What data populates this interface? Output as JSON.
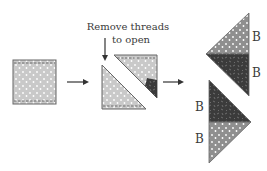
{
  "annotation": {
    "line1": "Remove threads",
    "line2": "to open"
  },
  "labels": {
    "top_upper": "B",
    "top_lower": "B",
    "bottom_upper": "B",
    "bottom_lower": "B"
  },
  "colors": {
    "light_fabric": "#c9c9c9",
    "medium_fabric": "#8a8a8a",
    "dark_fabric": "#3b3b3b",
    "outline": "#555555",
    "arrow": "#333333"
  }
}
